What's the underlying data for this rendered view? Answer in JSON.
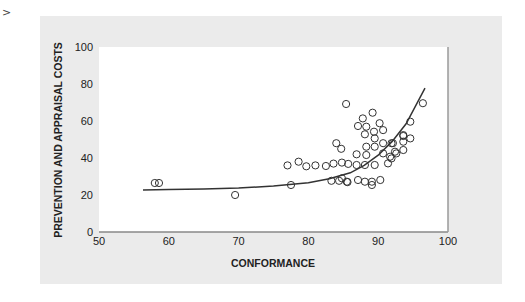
{
  "marker": ">",
  "chart_data": {
    "type": "scatter",
    "title": "",
    "xlabel": "CONFORMANCE",
    "ylabel": "PREVENTION AND APPRAISAL COSTS",
    "xlim": [
      50,
      100
    ],
    "ylim": [
      0,
      100
    ],
    "xticks": [
      50,
      60,
      70,
      80,
      90,
      100
    ],
    "yticks": [
      0,
      20,
      40,
      60,
      80,
      100
    ],
    "grid": false,
    "legend": null,
    "colors": {
      "panel": "#ebebeb",
      "plot": "#ffffff",
      "marker_stroke": "#333333",
      "curve": "#333333"
    },
    "points": [
      [
        58.0,
        26.5
      ],
      [
        58.6,
        26.5
      ],
      [
        69.5,
        20.0
      ],
      [
        77.5,
        25.4
      ],
      [
        77.0,
        36.0
      ],
      [
        78.6,
        38.0
      ],
      [
        79.7,
        35.5
      ],
      [
        81.0,
        36.0
      ],
      [
        82.5,
        35.7
      ],
      [
        83.6,
        37.0
      ],
      [
        84.8,
        37.5
      ],
      [
        85.7,
        36.8
      ],
      [
        83.3,
        27.7
      ],
      [
        84.4,
        27.7
      ],
      [
        85.6,
        27.0
      ],
      [
        84.0,
        48.0
      ],
      [
        84.7,
        45.0
      ],
      [
        85.4,
        69.2
      ],
      [
        89.2,
        64.5
      ],
      [
        87.8,
        61.4
      ],
      [
        87.1,
        57.3
      ],
      [
        88.3,
        56.9
      ],
      [
        90.2,
        58.8
      ],
      [
        88.1,
        52.8
      ],
      [
        89.4,
        54.2
      ],
      [
        90.7,
        55.1
      ],
      [
        89.5,
        50.6
      ],
      [
        88.3,
        46.1
      ],
      [
        89.5,
        46.1
      ],
      [
        90.7,
        48.0
      ],
      [
        91.9,
        48.0
      ],
      [
        86.9,
        42.0
      ],
      [
        88.3,
        41.6
      ],
      [
        90.7,
        42.5
      ],
      [
        91.7,
        40.7
      ],
      [
        92.6,
        42.5
      ],
      [
        91.9,
        39.8
      ],
      [
        91.4,
        37.1
      ],
      [
        86.9,
        36.2
      ],
      [
        88.1,
        36.2
      ],
      [
        89.5,
        36.2
      ],
      [
        84.8,
        29.0
      ],
      [
        85.5,
        27.2
      ],
      [
        87.1,
        28.1
      ],
      [
        88.1,
        27.2
      ],
      [
        89.1,
        27.2
      ],
      [
        89.1,
        25.4
      ],
      [
        90.3,
        28.1
      ],
      [
        96.4,
        69.6
      ],
      [
        94.6,
        59.6
      ],
      [
        93.6,
        51.9
      ],
      [
        94.6,
        50.6
      ],
      [
        93.6,
        48.8
      ],
      [
        92.1,
        48.0
      ],
      [
        92.4,
        43.4
      ],
      [
        93.6,
        44.3
      ],
      [
        93.6,
        52.4
      ]
    ],
    "fit_curve": {
      "type": "exponential",
      "x": [
        56.3,
        60,
        65,
        70,
        75,
        80,
        83,
        86,
        88,
        90,
        92,
        94,
        96.7
      ],
      "y": [
        22.7,
        23.0,
        23.3,
        23.8,
        24.8,
        26.6,
        28.8,
        32.0,
        36.0,
        41.5,
        49.0,
        58.5,
        77.8
      ]
    }
  }
}
